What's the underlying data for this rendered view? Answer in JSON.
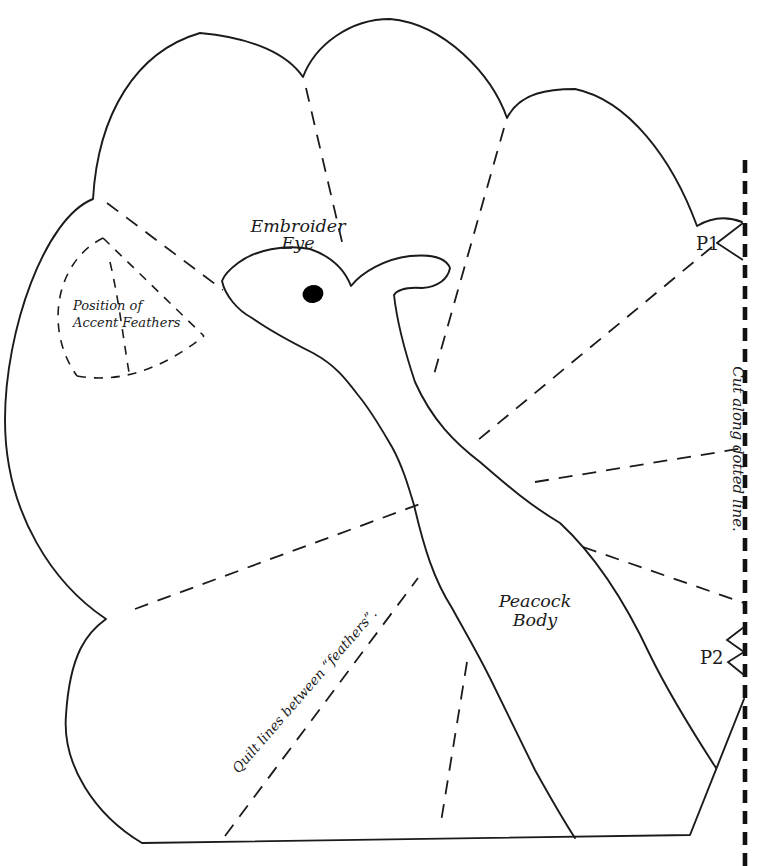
{
  "diagram": {
    "type": "sewing-pattern",
    "labels": {
      "embroider_eye_line1": "Embroider",
      "embroider_eye_line2": "Eye",
      "accent_position_line1": "Position of",
      "accent_position_line2": "Accent Feathers",
      "body_line1": "Peacock",
      "body_line2": "Body",
      "quilt_note": "Quilt lines between “feathers”.",
      "cut_note": "Cut along dotted line.",
      "notch1": "P1",
      "notch2": "P2"
    },
    "colors": {
      "line": "#1b1b1b",
      "cut_line": "#111111",
      "background": "#ffffff",
      "eye_fill": "#000000"
    }
  }
}
